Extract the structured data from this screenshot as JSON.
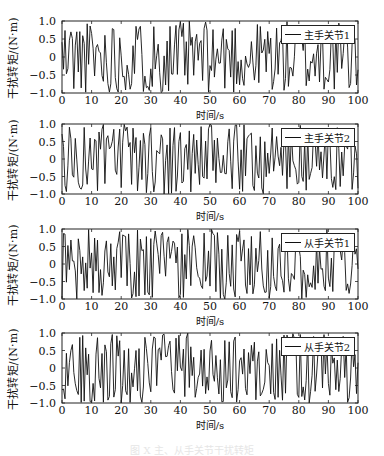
{
  "caption": "图 X  主、从手关节干扰转矩",
  "chart_data": [
    {
      "type": "line",
      "title": "",
      "xlabel": "时间/s",
      "ylabel": "干扰转矩/(N·m)",
      "xlim": [
        0,
        100
      ],
      "ylim": [
        -1.0,
        1.0
      ],
      "xticks": [
        "0",
        "10",
        "20",
        "30",
        "40",
        "50",
        "60",
        "70",
        "80",
        "90",
        "100"
      ],
      "yticks": [
        "1.0",
        "0.5",
        "0",
        "−0.5",
        "−1.0"
      ],
      "legend": [
        "主手关节1"
      ],
      "legend_position": "upper right",
      "grid": false,
      "series": [
        {
          "name": "主手关节1",
          "description": "random disturbance torque in [-1,1], ~0.5 s sampling"
        }
      ]
    },
    {
      "type": "line",
      "title": "",
      "xlabel": "时间/s",
      "ylabel": "干扰转矩/(N·m)",
      "xlim": [
        0,
        100
      ],
      "ylim": [
        -1.0,
        1.0
      ],
      "xticks": [
        "0",
        "10",
        "20",
        "30",
        "40",
        "50",
        "60",
        "70",
        "80",
        "90",
        "100"
      ],
      "yticks": [
        "1.0",
        "0.5",
        "0",
        "−0.5",
        "−1.0"
      ],
      "legend": [
        "主手关节2"
      ],
      "legend_position": "upper right",
      "grid": false,
      "series": [
        {
          "name": "主手关节2",
          "description": "random disturbance torque in [-1,1], ~0.5 s sampling"
        }
      ]
    },
    {
      "type": "line",
      "title": "",
      "xlabel": "时间/s",
      "ylabel": "干扰转矩/(N·m)",
      "xlim": [
        0,
        100
      ],
      "ylim": [
        -1.0,
        1.0
      ],
      "xticks": [
        "0",
        "10",
        "20",
        "30",
        "40",
        "50",
        "60",
        "70",
        "80",
        "90",
        "100"
      ],
      "yticks": [
        "1.0",
        "0.5",
        "0",
        "−0.5",
        "−1.0"
      ],
      "legend": [
        "从手关节1"
      ],
      "legend_position": "upper right",
      "grid": false,
      "series": [
        {
          "name": "从手关节1",
          "description": "random disturbance torque in [-1,1], ~0.5 s sampling"
        }
      ]
    },
    {
      "type": "line",
      "title": "",
      "xlabel": "时间/s",
      "ylabel": "干扰转矩/(N·m)",
      "xlim": [
        0,
        100
      ],
      "ylim": [
        -1.0,
        1.0
      ],
      "xticks": [
        "0",
        "10",
        "20",
        "30",
        "40",
        "50",
        "60",
        "70",
        "80",
        "90",
        "100"
      ],
      "yticks": [
        "1.0",
        "0.5",
        "0",
        "−0.5",
        "−1.0"
      ],
      "legend": [
        "从手关节2"
      ],
      "legend_position": "upper right",
      "grid": false,
      "series": [
        {
          "name": "从手关节2",
          "description": "random disturbance torque in [-1,1], ~0.5 s sampling"
        }
      ]
    }
  ],
  "panels": [
    {
      "seed": 11,
      "top": 21,
      "height": 72
    },
    {
      "seed": 23,
      "top": 124,
      "height": 70
    },
    {
      "seed": 37,
      "top": 229,
      "height": 70
    },
    {
      "seed": 53,
      "top": 333,
      "height": 70
    }
  ]
}
